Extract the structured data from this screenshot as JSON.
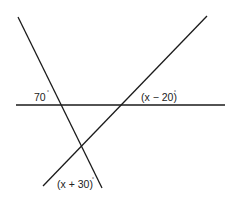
{
  "figure": {
    "lines": [
      {
        "name": "line-steep-descending",
        "x1": 18,
        "y1": 17,
        "x2": 102,
        "y2": 188
      },
      {
        "name": "line-ascending",
        "x1": 43,
        "y1": 186,
        "x2": 207,
        "y2": 16
      },
      {
        "name": "line-horizontal",
        "x1": 16,
        "y1": 105,
        "x2": 225,
        "y2": 105
      }
    ],
    "labels": {
      "angle_left": "70",
      "angle_right": "(x − 20)",
      "angle_bottom": "(x + 30)",
      "degree_symbol": "°"
    },
    "stroke_color": "#1a1a1a"
  }
}
